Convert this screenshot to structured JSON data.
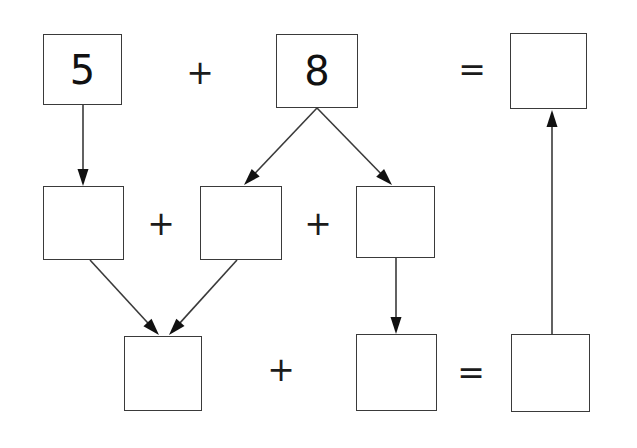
{
  "diagram": {
    "stroke_color": "#3a3a3a",
    "text_color": "#111111",
    "background_color": "#ffffff",
    "boxes": [
      {
        "id": "addend-1",
        "label": "5",
        "x": 43,
        "y": 34,
        "w": 79,
        "h": 71
      },
      {
        "id": "addend-2",
        "label": "8",
        "x": 276,
        "y": 34,
        "w": 82,
        "h": 74
      },
      {
        "id": "top-result",
        "label": "",
        "x": 510,
        "y": 33,
        "w": 77,
        "h": 76
      },
      {
        "id": "mid-left",
        "label": "",
        "x": 43,
        "y": 186,
        "w": 81,
        "h": 74
      },
      {
        "id": "mid-center",
        "label": "",
        "x": 200,
        "y": 186,
        "w": 82,
        "h": 74
      },
      {
        "id": "mid-right",
        "label": "",
        "x": 356,
        "y": 186,
        "w": 79,
        "h": 72
      },
      {
        "id": "bottom-left",
        "label": "",
        "x": 124,
        "y": 336,
        "w": 78,
        "h": 75
      },
      {
        "id": "bottom-center",
        "label": "",
        "x": 356,
        "y": 334,
        "w": 81,
        "h": 77
      },
      {
        "id": "bottom-right",
        "label": "",
        "x": 511,
        "y": 334,
        "w": 79,
        "h": 78
      }
    ],
    "operators": [
      {
        "id": "plus-top",
        "symbol": "+",
        "x": 186,
        "y": 58,
        "w": 28,
        "h": 28
      },
      {
        "id": "equals-top",
        "symbol": "=",
        "x": 458,
        "y": 55,
        "w": 28,
        "h": 28
      },
      {
        "id": "plus-middle-left",
        "symbol": "+",
        "x": 147,
        "y": 209,
        "w": 28,
        "h": 28
      },
      {
        "id": "plus-middle-right",
        "symbol": "+",
        "x": 304,
        "y": 209,
        "w": 28,
        "h": 28
      },
      {
        "id": "plus-bottom",
        "symbol": "+",
        "x": 267,
        "y": 355,
        "w": 28,
        "h": 28
      },
      {
        "id": "equals-bottom",
        "symbol": "=",
        "x": 457,
        "y": 358,
        "w": 28,
        "h": 28
      }
    ],
    "arrows": [
      {
        "id": "arrow-addend1-to-midleft",
        "x1": 83,
        "y1": 105,
        "x2": 83,
        "y2": 186
      },
      {
        "id": "arrow-addend2-to-midcenter",
        "x1": 317,
        "y1": 108,
        "x2": 244,
        "y2": 185
      },
      {
        "id": "arrow-addend2-to-midright",
        "x1": 317,
        "y1": 108,
        "x2": 392,
        "y2": 185
      },
      {
        "id": "arrow-midleft-to-bottomleft",
        "x1": 90,
        "y1": 260,
        "x2": 159,
        "y2": 335
      },
      {
        "id": "arrow-midcenter-to-bottomleft",
        "x1": 237,
        "y1": 260,
        "x2": 169,
        "y2": 335
      },
      {
        "id": "arrow-midright-to-bottomcenter",
        "x1": 396,
        "y1": 258,
        "x2": 396,
        "y2": 334
      },
      {
        "id": "arrow-bottomright-to-topresult",
        "x1": 552,
        "y1": 334,
        "x2": 552,
        "y2": 110
      }
    ]
  }
}
